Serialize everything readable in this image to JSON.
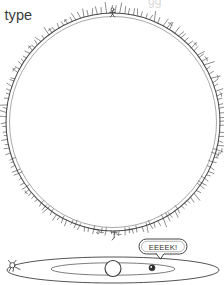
{
  "page": {
    "background_color": "#ffffff",
    "ink_color": "#4a4a4a",
    "dark_ink_color": "#2e2e2e",
    "caption_color": "#3a3a3a",
    "medium": "hand-drawn line illustration"
  },
  "caption": {
    "clipped_text": "l type",
    "top_clipped_text": "gg"
  },
  "figures": {
    "face_on": {
      "name": "face-on spiky ring",
      "center_x": 113,
      "center_y": 122,
      "radius_x": 107,
      "radius_y": 109,
      "spike_count": 150,
      "description": "large circle outline with fine radiating hair-like spikes and tiny standing figures"
    },
    "edge_on": {
      "name": "edge-on flattened disk",
      "center_x": 113,
      "center_y": 270,
      "radius_x": 106,
      "radius_y": 13,
      "inner_ellipse_radius_x": 62,
      "inner_ellipse_radius_y": 6,
      "bulge_radius": 8,
      "marker_dot": {
        "x": 152,
        "y": 268,
        "radius": 3,
        "label": "dot-marker"
      },
      "left_figure": {
        "x": 14,
        "y": 266,
        "label": "tiny-figure"
      }
    },
    "speech_bubble": {
      "text": "EEEEK!",
      "x": 139,
      "y": 239,
      "width": 48,
      "height": 15,
      "tail_x": 160,
      "tail_y": 254
    }
  }
}
